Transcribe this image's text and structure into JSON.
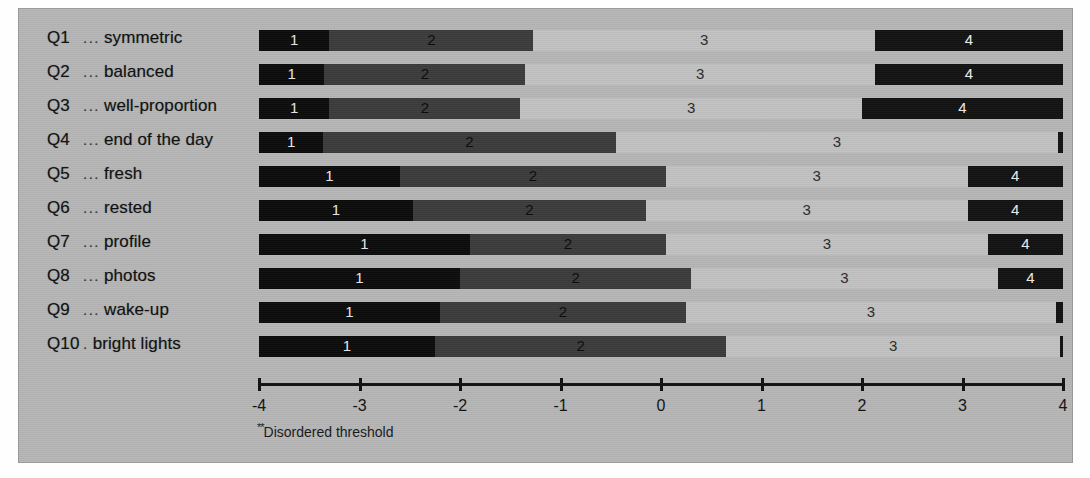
{
  "figure": {
    "background_color": "#b6b6b6",
    "page_color": "#ffffff",
    "footnote": "Disordered threshold",
    "footnote_marker": "**"
  },
  "axis": {
    "ticks": [
      -4,
      -3,
      -2,
      -1,
      0,
      1,
      2,
      3,
      4
    ],
    "tick_labels": [
      "-4",
      "-3",
      "-2",
      "-1",
      "0",
      "1",
      "2",
      "3",
      "4"
    ],
    "min": -4,
    "max": 4
  },
  "legend": {
    "categories": [
      "1",
      "2",
      "3",
      "4"
    ],
    "colors": [
      "#0b0b0b",
      "#3b3b3b",
      "#c2c2c2",
      "#121212"
    ]
  },
  "chart_data": {
    "type": "bar",
    "subtype": "diverging-stacked-threshold",
    "title": "",
    "xlabel": "",
    "ylabel": "",
    "xlim": [
      -4,
      4
    ],
    "grid": false,
    "legend_position": "none",
    "annotations": [
      "**Disordered threshold"
    ],
    "categories": [
      "Q1 ... symmetric",
      "Q2 ... balanced",
      "Q3 ... well-proportion",
      "Q4 ... end of the day",
      "Q5 ... fresh",
      "Q6 ... rested",
      "Q7 ... profile",
      "Q8 ... photos",
      "Q9 ... wake-up",
      "Q10 . bright lights"
    ],
    "segment_labels": [
      "1",
      "2",
      "3",
      "4"
    ],
    "series": [
      {
        "name": "1",
        "values": [
          0.7,
          0.65,
          0.7,
          0.64,
          1.4,
          1.53,
          2.1,
          2.0,
          1.8,
          1.75
        ]
      },
      {
        "name": "2",
        "values": [
          2.03,
          2.0,
          1.9,
          2.91,
          2.65,
          2.32,
          1.95,
          2.3,
          2.45,
          2.9
        ]
      },
      {
        "name": "3",
        "values": [
          3.4,
          3.48,
          3.4,
          4.4,
          3.0,
          3.2,
          3.2,
          3.05,
          3.68,
          3.32
        ]
      },
      {
        "name": "4",
        "values": [
          1.87,
          1.87,
          2.0,
          0.05,
          0.95,
          0.95,
          0.75,
          0.65,
          0.07,
          0.03
        ]
      }
    ],
    "segments_by_row": [
      {
        "row": "Q1 ... symmetric",
        "boundaries": [
          -4.0,
          -3.3,
          -1.27,
          2.13,
          4.0
        ]
      },
      {
        "row": "Q2 ... balanced",
        "boundaries": [
          -4.0,
          -3.35,
          -1.35,
          2.13,
          4.0
        ]
      },
      {
        "row": "Q3 ... well-proportion",
        "boundaries": [
          -4.0,
          -3.3,
          -1.4,
          2.0,
          4.0
        ]
      },
      {
        "row": "Q4 ... end of the day",
        "boundaries": [
          -4.0,
          -3.36,
          -0.45,
          3.95,
          4.0
        ]
      },
      {
        "row": "Q5 ... fresh",
        "boundaries": [
          -4.0,
          -2.6,
          0.05,
          3.05,
          4.0
        ]
      },
      {
        "row": "Q6 ... rested",
        "boundaries": [
          -4.0,
          -2.47,
          -0.15,
          3.05,
          4.0
        ]
      },
      {
        "row": "Q7 ... profile",
        "boundaries": [
          -4.0,
          -1.9,
          0.05,
          3.25,
          4.0
        ]
      },
      {
        "row": "Q8 ... photos",
        "boundaries": [
          -4.0,
          -2.0,
          0.3,
          3.35,
          4.0
        ]
      },
      {
        "row": "Q9 ... wake-up",
        "boundaries": [
          -4.0,
          -2.2,
          0.25,
          3.93,
          4.0
        ]
      },
      {
        "row": "Q10 . bright lights",
        "boundaries": [
          -4.0,
          -2.25,
          0.65,
          3.97,
          4.0
        ]
      }
    ]
  },
  "rows": [
    {
      "qid": "Q1",
      "dots": "...",
      "label": "symmetric"
    },
    {
      "qid": "Q2",
      "dots": "...",
      "label": "balanced"
    },
    {
      "qid": "Q3",
      "dots": "...",
      "label": "well-proportion"
    },
    {
      "qid": "Q4",
      "dots": "...",
      "label": "end of the day"
    },
    {
      "qid": "Q5",
      "dots": "...",
      "label": "fresh"
    },
    {
      "qid": "Q6",
      "dots": "...",
      "label": "rested"
    },
    {
      "qid": "Q7",
      "dots": "...",
      "label": "profile"
    },
    {
      "qid": "Q8",
      "dots": "...",
      "label": "photos"
    },
    {
      "qid": "Q9",
      "dots": "...",
      "label": "wake-up"
    },
    {
      "qid": "Q10",
      "dots": ".",
      "label": "bright lights"
    }
  ]
}
